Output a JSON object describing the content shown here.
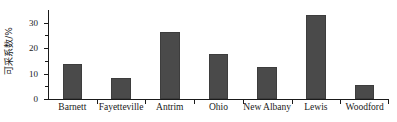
{
  "chart_data": {
    "type": "bar",
    "title": "",
    "xlabel": "",
    "ylabel": "可采系数/%",
    "categories": [
      "Barnett",
      "Fayetteville",
      "Antrim",
      "Ohio",
      "New Albany",
      "Lewis",
      "Woodford"
    ],
    "values": [
      13.8,
      8.2,
      26.2,
      17.8,
      12.5,
      33.2,
      5.5
    ],
    "ylim": [
      0,
      35
    ],
    "ytick_labels": [
      "0",
      "10",
      "20",
      "30"
    ],
    "ytick_values": [
      0,
      10,
      20,
      30
    ],
    "yminor_values": [
      5,
      15,
      25
    ],
    "grid": false,
    "legend": null,
    "bar_color": "#4a4a4a",
    "axis_color": "#1a1a1a"
  },
  "axis": {
    "y_title": "可采系数/%"
  }
}
